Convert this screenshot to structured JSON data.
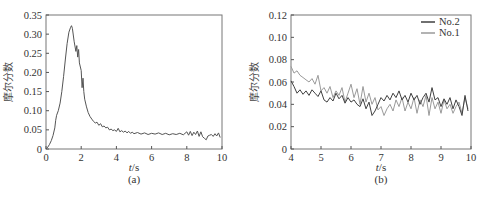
{
  "chart_data": [
    {
      "id": "a",
      "type": "line",
      "panel_label": "(a)",
      "title": "",
      "xlabel_italic": "t",
      "xlabel_unit": "/s",
      "ylabel": "摩尔分数",
      "xlim": [
        0,
        10
      ],
      "ylim": [
        0,
        0.35
      ],
      "xticks": [
        0,
        2,
        4,
        6,
        8,
        10
      ],
      "xtick_labels": [
        "0",
        "2",
        "4",
        "6",
        "8",
        "10"
      ],
      "yticks": [
        0,
        0.05,
        0.1,
        0.15,
        0.2,
        0.25,
        0.3,
        0.35
      ],
      "ytick_labels": [
        "0",
        "0.05",
        "0.10",
        "0.15",
        "0.20",
        "0.25",
        "0.30",
        "0.35"
      ],
      "grid": false,
      "legend": null,
      "series": [
        {
          "name": "mole fraction",
          "color": "#555555",
          "x": [
            0,
            0.1,
            0.2,
            0.3,
            0.4,
            0.5,
            0.55,
            0.6,
            0.7,
            0.8,
            0.9,
            1.0,
            1.1,
            1.2,
            1.3,
            1.4,
            1.45,
            1.5,
            1.6,
            1.7,
            1.75,
            1.8,
            1.85,
            1.9,
            2.0,
            2.05,
            2.1,
            2.15,
            2.2,
            2.3,
            2.4,
            2.5,
            2.6,
            2.7,
            2.8,
            2.9,
            3.0,
            3.1,
            3.2,
            3.3,
            3.4,
            3.5,
            3.6,
            3.7,
            3.8,
            3.9,
            4.0,
            4.1,
            4.2,
            4.3,
            4.4,
            4.5,
            4.6,
            4.7,
            4.8,
            4.9,
            5.0,
            5.2,
            5.4,
            5.6,
            5.8,
            6.0,
            6.2,
            6.4,
            6.6,
            6.8,
            7.0,
            7.2,
            7.4,
            7.6,
            7.8,
            8.0,
            8.1,
            8.2,
            8.3,
            8.4,
            8.5,
            8.6,
            8.7,
            8.8,
            8.9,
            9.0,
            9.1,
            9.2,
            9.3,
            9.4,
            9.5,
            9.6,
            9.7,
            9.8,
            9.9
          ],
          "y": [
            0.0,
            0.005,
            0.012,
            0.022,
            0.035,
            0.055,
            0.075,
            0.088,
            0.1,
            0.12,
            0.15,
            0.19,
            0.235,
            0.275,
            0.305,
            0.318,
            0.322,
            0.315,
            0.28,
            0.255,
            0.27,
            0.24,
            0.26,
            0.225,
            0.205,
            0.16,
            0.185,
            0.15,
            0.13,
            0.11,
            0.095,
            0.085,
            0.078,
            0.072,
            0.068,
            0.07,
            0.062,
            0.066,
            0.058,
            0.06,
            0.055,
            0.057,
            0.05,
            0.052,
            0.048,
            0.05,
            0.046,
            0.054,
            0.045,
            0.048,
            0.044,
            0.047,
            0.042,
            0.046,
            0.041,
            0.044,
            0.04,
            0.043,
            0.039,
            0.042,
            0.038,
            0.041,
            0.039,
            0.042,
            0.038,
            0.041,
            0.037,
            0.04,
            0.038,
            0.041,
            0.037,
            0.045,
            0.036,
            0.046,
            0.035,
            0.044,
            0.038,
            0.047,
            0.033,
            0.045,
            0.032,
            0.028,
            0.024,
            0.034,
            0.036,
            0.038,
            0.033,
            0.04,
            0.034,
            0.042,
            0.03
          ]
        }
      ]
    },
    {
      "id": "b",
      "type": "line",
      "panel_label": "(b)",
      "title": "",
      "xlabel_italic": "t",
      "xlabel_unit": "/s",
      "ylabel": "摩尔分数",
      "xlim": [
        4,
        10
      ],
      "ylim": [
        0,
        0.12
      ],
      "xticks": [
        4,
        5,
        6,
        7,
        8,
        9,
        10
      ],
      "xtick_labels": [
        "4",
        "5",
        "6",
        "7",
        "8",
        "9",
        "10"
      ],
      "yticks": [
        0,
        0.02,
        0.04,
        0.06,
        0.08,
        0.1,
        0.12
      ],
      "ytick_labels": [
        "0",
        "0.02",
        "0.04",
        "0.06",
        "0.08",
        "0.10",
        "0.12"
      ],
      "grid": false,
      "legend": {
        "position": "upper right",
        "entries": [
          "No.2",
          "No.1"
        ]
      },
      "series": [
        {
          "name": "No.2",
          "color": "#404040",
          "x": [
            4.0,
            4.1,
            4.2,
            4.3,
            4.4,
            4.5,
            4.6,
            4.7,
            4.8,
            4.9,
            5.0,
            5.1,
            5.2,
            5.3,
            5.4,
            5.5,
            5.6,
            5.7,
            5.8,
            5.9,
            6.0,
            6.1,
            6.2,
            6.3,
            6.4,
            6.5,
            6.6,
            6.7,
            6.8,
            6.9,
            7.0,
            7.1,
            7.2,
            7.3,
            7.4,
            7.5,
            7.6,
            7.7,
            7.8,
            7.9,
            8.0,
            8.1,
            8.2,
            8.3,
            8.4,
            8.5,
            8.6,
            8.7,
            8.8,
            8.9,
            9.0,
            9.1,
            9.2,
            9.3,
            9.4,
            9.5,
            9.6,
            9.7,
            9.8,
            9.9
          ],
          "y": [
            0.061,
            0.056,
            0.05,
            0.053,
            0.049,
            0.052,
            0.048,
            0.053,
            0.05,
            0.047,
            0.052,
            0.044,
            0.042,
            0.046,
            0.043,
            0.05,
            0.045,
            0.048,
            0.041,
            0.046,
            0.042,
            0.044,
            0.04,
            0.038,
            0.045,
            0.036,
            0.042,
            0.03,
            0.034,
            0.04,
            0.046,
            0.043,
            0.048,
            0.044,
            0.05,
            0.046,
            0.052,
            0.044,
            0.048,
            0.042,
            0.05,
            0.044,
            0.048,
            0.04,
            0.046,
            0.05,
            0.042,
            0.055,
            0.044,
            0.046,
            0.038,
            0.045,
            0.04,
            0.046,
            0.036,
            0.044,
            0.038,
            0.03,
            0.048,
            0.034
          ]
        },
        {
          "name": "No.1",
          "color": "#9a9a9a",
          "x": [
            4.0,
            4.1,
            4.2,
            4.3,
            4.4,
            4.5,
            4.6,
            4.7,
            4.8,
            4.9,
            5.0,
            5.1,
            5.2,
            5.3,
            5.4,
            5.5,
            5.6,
            5.7,
            5.8,
            5.9,
            6.0,
            6.1,
            6.2,
            6.3,
            6.4,
            6.5,
            6.6,
            6.7,
            6.8,
            6.9,
            7.0,
            7.1,
            7.2,
            7.3,
            7.4,
            7.5,
            7.6,
            7.7,
            7.8,
            7.9,
            8.0,
            8.1,
            8.2,
            8.3,
            8.4,
            8.5,
            8.6,
            8.7,
            8.8,
            8.9,
            9.0,
            9.1,
            9.2,
            9.3,
            9.4,
            9.5,
            9.6,
            9.7,
            9.8,
            9.9
          ],
          "y": [
            0.074,
            0.068,
            0.07,
            0.066,
            0.064,
            0.062,
            0.06,
            0.063,
            0.058,
            0.066,
            0.052,
            0.055,
            0.05,
            0.056,
            0.046,
            0.052,
            0.048,
            0.055,
            0.042,
            0.05,
            0.058,
            0.046,
            0.054,
            0.04,
            0.056,
            0.042,
            0.05,
            0.04,
            0.046,
            0.035,
            0.038,
            0.03,
            0.036,
            0.04,
            0.034,
            0.044,
            0.038,
            0.046,
            0.034,
            0.042,
            0.036,
            0.046,
            0.032,
            0.044,
            0.038,
            0.048,
            0.03,
            0.046,
            0.036,
            0.042,
            0.032,
            0.044,
            0.036,
            0.04,
            0.032,
            0.038,
            0.042,
            0.032,
            0.046,
            0.036
          ]
        }
      ]
    }
  ]
}
